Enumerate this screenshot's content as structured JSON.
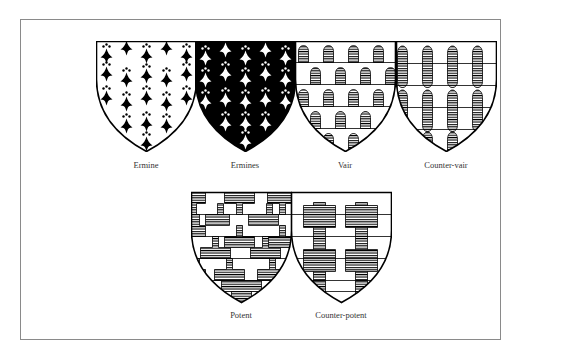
{
  "figure": {
    "colors": {
      "frame": "#8a8a8a",
      "ink": "#000000",
      "field": "#ffffff",
      "label": "#333333"
    }
  },
  "shields": [
    {
      "id": "ermine",
      "label": "Ermine",
      "pattern": "ermine-spots-black-on-white"
    },
    {
      "id": "ermines",
      "label": "Ermines",
      "pattern": "ermine-spots-white-on-black"
    },
    {
      "id": "vair",
      "label": "Vair",
      "pattern": "vair-bells-hatched"
    },
    {
      "id": "counter-vair",
      "label": "Counter-vair",
      "pattern": "counter-vair-bells-hatched"
    },
    {
      "id": "potent",
      "label": "Potent",
      "pattern": "potent-t-shapes-hatched"
    },
    {
      "id": "counter-potent",
      "label": "Counter-potent",
      "pattern": "counter-potent-t-shapes-hatched"
    }
  ]
}
